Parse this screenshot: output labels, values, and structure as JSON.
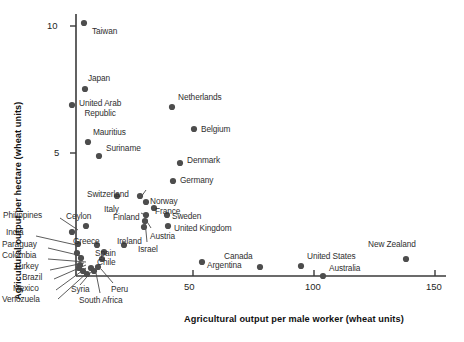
{
  "chart_data": {
    "type": "scatter",
    "title": "",
    "xlabel": "Agricultural output per male worker (wheat units)",
    "ylabel": "Agricultural output per hectare (wheat units)",
    "xlim": [
      0,
      152
    ],
    "ylim": [
      0,
      10.9
    ],
    "xticks": [
      50,
      100,
      150
    ],
    "yticks": [
      5,
      10
    ],
    "grid": false,
    "legend": null,
    "points": [
      {
        "label": "Taiwan",
        "x": 5.0,
        "y": 10.1,
        "px": 84,
        "py": 23,
        "lx": 92,
        "ly": 27,
        "anchor": "left"
      },
      {
        "label": "Japan",
        "x": 5.4,
        "y": 7.5,
        "px": 85,
        "py": 89,
        "lx": 88,
        "ly": 74,
        "anchor": "left"
      },
      {
        "label": "United Arab\nRepublic",
        "x": 0.0,
        "y": 6.9,
        "px": 72,
        "py": 105,
        "lx": 79,
        "ly": 99,
        "anchor": "left"
      },
      {
        "label": "Mauritius",
        "x": 6.6,
        "y": 5.4,
        "px": 88,
        "py": 142,
        "lx": 93,
        "ly": 128,
        "anchor": "left"
      },
      {
        "label": "Suriname",
        "x": 11.2,
        "y": 4.9,
        "px": 99,
        "py": 156,
        "lx": 106,
        "ly": 144,
        "anchor": "left"
      },
      {
        "label": "Netherlands",
        "x": 41.3,
        "y": 6.8,
        "px": 172,
        "py": 107,
        "lx": 178,
        "ly": 93,
        "anchor": "left"
      },
      {
        "label": "Belgium",
        "x": 50.4,
        "y": 5.9,
        "px": 194,
        "py": 129,
        "lx": 201,
        "ly": 125,
        "anchor": "left"
      },
      {
        "label": "Denmark",
        "x": 44.6,
        "y": 4.6,
        "px": 180,
        "py": 163,
        "lx": 187,
        "ly": 156,
        "anchor": "left"
      },
      {
        "label": "Germany",
        "x": 41.7,
        "y": 3.9,
        "px": 173,
        "py": 181,
        "lx": 180,
        "ly": 176,
        "anchor": "left"
      },
      {
        "label": "Switzerland",
        "x": 28.1,
        "y": 3.3,
        "px": 140,
        "py": 196,
        "lx": 87,
        "ly": 190,
        "anchor": "left"
      },
      {
        "label": "Italy",
        "x": 18.6,
        "y": 3.3,
        "px": 117,
        "py": 196,
        "lx": 104,
        "ly": 205,
        "anchor": "left"
      },
      {
        "label": "Norway",
        "x": 30.6,
        "y": 3.1,
        "px": 146,
        "py": 202,
        "lx": 150,
        "ly": 197,
        "anchor": "left"
      },
      {
        "label": "France",
        "x": 33.9,
        "y": 2.9,
        "px": 154,
        "py": 208,
        "lx": 155,
        "ly": 207,
        "anchor": "left"
      },
      {
        "label": "Finland",
        "x": 30.6,
        "y": 2.6,
        "px": 146,
        "py": 215,
        "lx": 113,
        "ly": 213,
        "anchor": "left"
      },
      {
        "label": "Sweden",
        "x": 39.3,
        "y": 2.6,
        "px": 167,
        "py": 215,
        "lx": 172,
        "ly": 212,
        "anchor": "left"
      },
      {
        "label": "Austria",
        "x": 30.2,
        "y": 2.4,
        "px": 145,
        "py": 221,
        "lx": 150,
        "ly": 232,
        "anchor": "left"
      },
      {
        "label": "United Kingdom",
        "x": 39.7,
        "y": 2.2,
        "px": 168,
        "py": 226,
        "lx": 174,
        "ly": 224,
        "anchor": "left"
      },
      {
        "label": "Israel",
        "x": 29.8,
        "y": 2.2,
        "px": 144,
        "py": 227,
        "lx": 138,
        "ly": 245,
        "anchor": "left"
      },
      {
        "label": "Ceylon",
        "x": 5.8,
        "y": 2.2,
        "px": 86,
        "py": 226,
        "lx": 66,
        "ly": 212,
        "anchor": "left"
      },
      {
        "label": "Philippines",
        "x": 0.0,
        "y": 2.0,
        "px": 72,
        "py": 232,
        "lx": 3,
        "ly": 211,
        "anchor": "left"
      },
      {
        "label": "India",
        "x": 2.5,
        "y": 1.5,
        "px": 78,
        "py": 244,
        "lx": 6,
        "ly": 228,
        "anchor": "left"
      },
      {
        "label": "Greece",
        "x": 10.3,
        "y": 1.5,
        "px": 97,
        "py": 245,
        "lx": 73,
        "ly": 237,
        "anchor": "left"
      },
      {
        "label": "Ireland",
        "x": 21.5,
        "y": 1.5,
        "px": 124,
        "py": 245,
        "lx": 117,
        "ly": 237,
        "anchor": "left"
      },
      {
        "label": "Paraguay",
        "x": 2.1,
        "y": 1.1,
        "px": 77,
        "py": 253,
        "lx": 2,
        "ly": 240,
        "anchor": "left"
      },
      {
        "label": "Spain",
        "x": 13.2,
        "y": 1.2,
        "px": 104,
        "py": 252,
        "lx": 95,
        "ly": 249,
        "anchor": "left"
      },
      {
        "label": "Colombia",
        "x": 3.7,
        "y": 0.85,
        "px": 81,
        "py": 258,
        "lx": 2,
        "ly": 251,
        "anchor": "left"
      },
      {
        "label": "Chile",
        "x": 12.4,
        "y": 0.8,
        "px": 102,
        "py": 259,
        "lx": 97,
        "ly": 258,
        "anchor": "left"
      },
      {
        "label": "Turkey",
        "x": 3.3,
        "y": 0.6,
        "px": 80,
        "py": 265,
        "lx": 14,
        "ly": 262,
        "anchor": "left"
      },
      {
        "label": "Brazil",
        "x": 2.9,
        "y": 0.45,
        "px": 79,
        "py": 268,
        "lx": 22,
        "ly": 273,
        "anchor": "left"
      },
      {
        "label": "Syria",
        "x": 7.9,
        "y": 0.45,
        "px": 91,
        "py": 268,
        "lx": 71,
        "ly": 285,
        "anchor": "left"
      },
      {
        "label": "Peru",
        "x": 10.7,
        "y": 0.5,
        "px": 98,
        "py": 267,
        "lx": 111,
        "ly": 285,
        "anchor": "left"
      },
      {
        "label": "Mexico",
        "x": 4.5,
        "y": 0.35,
        "px": 83,
        "py": 271,
        "lx": 13,
        "ly": 284,
        "anchor": "left"
      },
      {
        "label": "South Africa",
        "x": 9.1,
        "y": 0.35,
        "px": 94,
        "py": 271,
        "lx": 79,
        "ly": 296,
        "anchor": "left"
      },
      {
        "label": "Venozuela",
        "x": 6.2,
        "y": 0.25,
        "px": 87,
        "py": 274,
        "lx": 2,
        "ly": 295,
        "anchor": "left"
      },
      {
        "label": "Argentina",
        "x": 53.7,
        "y": 0.7,
        "px": 202,
        "py": 262,
        "lx": 207,
        "ly": 261,
        "anchor": "left"
      },
      {
        "label": "Canada",
        "x": 77.7,
        "y": 0.5,
        "px": 260,
        "py": 267,
        "lx": 224,
        "ly": 252,
        "anchor": "left"
      },
      {
        "label": "United States",
        "x": 94.6,
        "y": 0.55,
        "px": 301,
        "py": 266,
        "lx": 307,
        "ly": 252,
        "anchor": "left"
      },
      {
        "label": "Australia",
        "x": 103.7,
        "y": 0.15,
        "px": 323,
        "py": 276,
        "lx": 329,
        "ly": 264,
        "anchor": "left"
      },
      {
        "label": "New Zealand",
        "x": 138.0,
        "y": 0.8,
        "px": 406,
        "py": 259,
        "lx": 368,
        "ly": 240,
        "anchor": "left"
      }
    ],
    "leaders": [
      {
        "from": "Philippines",
        "x1": 60,
        "y1": 218,
        "x2": 78,
        "y2": 230
      },
      {
        "from": "India",
        "x1": 36,
        "y1": 236,
        "x2": 76,
        "y2": 245
      },
      {
        "from": "Paraguay",
        "x1": 48,
        "y1": 248,
        "x2": 82,
        "y2": 256
      },
      {
        "from": "Colombia",
        "x1": 48,
        "y1": 259,
        "x2": 86,
        "y2": 262
      },
      {
        "from": "Turkey",
        "x1": 50,
        "y1": 270,
        "x2": 84,
        "y2": 263
      },
      {
        "from": "Brazil",
        "x1": 54,
        "y1": 279,
        "x2": 86,
        "y2": 265
      },
      {
        "from": "Mexico",
        "x1": 56,
        "y1": 290,
        "x2": 86,
        "y2": 268
      },
      {
        "from": "Venozuela",
        "x1": 58,
        "y1": 299,
        "x2": 88,
        "y2": 272
      },
      {
        "from": "Syria",
        "x1": 80,
        "y1": 285,
        "x2": 92,
        "y2": 271
      },
      {
        "from": "South Africa",
        "x1": 100,
        "y1": 293,
        "x2": 96,
        "y2": 273
      },
      {
        "from": "Peru",
        "x1": 113,
        "y1": 283,
        "x2": 101,
        "y2": 269
      },
      {
        "from": "Switzerland",
        "x1": 146,
        "y1": 190,
        "x2": 141,
        "y2": 197
      },
      {
        "from": "Austria",
        "x1": 151,
        "y1": 228,
        "x2": 146,
        "y2": 220
      },
      {
        "from": "Israel",
        "x1": 147,
        "y1": 242,
        "x2": 145,
        "y2": 221
      },
      {
        "from": "Finland",
        "x1": 141,
        "y1": 213,
        "x2": 145,
        "y2": 215
      }
    ]
  },
  "axes": {
    "x_tick_labels": [
      "50",
      "100",
      "150"
    ],
    "y_tick_labels": [
      "5",
      "10"
    ],
    "x_title": "Agricultural output per male worker (wheat units)",
    "y_title": "Agricultural output per hectare (wheat units)"
  }
}
